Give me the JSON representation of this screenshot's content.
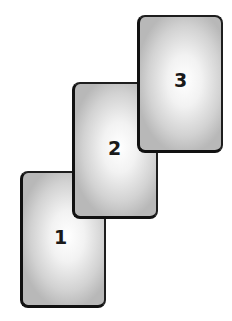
{
  "diagram": {
    "cards": [
      {
        "label": "1",
        "x": 20,
        "y": 171,
        "w": 86,
        "h": 137
      },
      {
        "label": "2",
        "x": 72,
        "y": 82,
        "w": 86,
        "h": 137
      },
      {
        "label": "3",
        "x": 137,
        "y": 15,
        "w": 86,
        "h": 138
      }
    ]
  }
}
